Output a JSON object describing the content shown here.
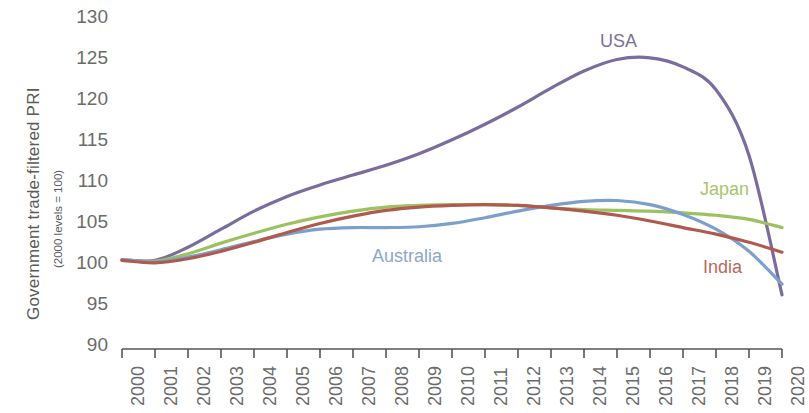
{
  "chart_data": {
    "type": "line",
    "title": "",
    "subtitle": "",
    "ylabel": "Government trade-filtered PRI",
    "ylabel_sub": "(2000 levels = 100)",
    "xlabel": "",
    "ylim": [
      90,
      130
    ],
    "yticks": [
      130,
      125,
      120,
      115,
      110,
      105,
      100,
      95,
      90
    ],
    "grid": false,
    "legend_position": "inline-annotations",
    "categories": [
      "2000",
      "2001",
      "2002",
      "2003",
      "2004",
      "2005",
      "2006",
      "2007",
      "2008",
      "2009",
      "2010",
      "2011",
      "2012",
      "2013",
      "2014",
      "2015",
      "2016",
      "2017",
      "2018",
      "2019",
      "2020"
    ],
    "series": [
      {
        "name": "USA",
        "color": "#7a6d9e",
        "label_color": "#7b7196",
        "values": [
          100.3,
          100.2,
          101.8,
          104.0,
          106.2,
          108.0,
          109.4,
          110.6,
          111.8,
          113.2,
          114.9,
          116.8,
          118.9,
          121.2,
          123.3,
          124.7,
          124.9,
          123.8,
          121.0,
          113.0,
          96.0
        ]
      },
      {
        "name": "Japan",
        "color": "#9cc161",
        "label_color": "#a9c46a",
        "values": [
          100.2,
          100.1,
          101.0,
          102.3,
          103.5,
          104.6,
          105.5,
          106.2,
          106.7,
          106.9,
          107.0,
          107.0,
          106.9,
          106.6,
          106.4,
          106.3,
          106.2,
          106.0,
          105.7,
          105.2,
          104.2
        ]
      },
      {
        "name": "Australia",
        "color": "#7d9fcc",
        "label_color": "#8ca6cc",
        "values": [
          100.3,
          100.0,
          100.6,
          101.5,
          102.5,
          103.4,
          104.0,
          104.2,
          104.2,
          104.3,
          104.7,
          105.4,
          106.2,
          106.9,
          107.4,
          107.5,
          107.0,
          105.8,
          104.0,
          101.3,
          97.3
        ]
      },
      {
        "name": "India",
        "color": "#b05a4e",
        "label_color": "#b5695c",
        "values": [
          100.2,
          99.9,
          100.4,
          101.3,
          102.4,
          103.6,
          104.7,
          105.6,
          106.3,
          106.7,
          106.9,
          107.0,
          106.9,
          106.6,
          106.2,
          105.7,
          105.0,
          104.2,
          103.4,
          102.4,
          101.2
        ]
      }
    ],
    "annotations": [
      {
        "text": "USA",
        "x_px": 600,
        "y_px": 32,
        "color": "#7b7196"
      },
      {
        "text": "Japan",
        "x_px": 700,
        "y_px": 180,
        "color": "#a9c46a"
      },
      {
        "text": "Australia",
        "x_px": 372,
        "y_px": 247,
        "color": "#8ca6cc"
      },
      {
        "text": "India",
        "x_px": 703,
        "y_px": 258,
        "color": "#b5695c"
      }
    ]
  }
}
